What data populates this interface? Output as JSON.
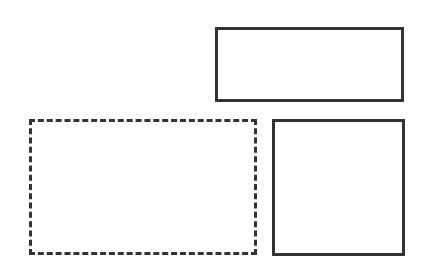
{
  "diagram": {
    "shapes": [
      {
        "id": "top-right-rectangle",
        "kind": "rectangle",
        "stroke": "solid",
        "color": "#333333"
      },
      {
        "id": "dashed-rectangle",
        "kind": "rectangle",
        "stroke": "dashed",
        "color": "#333333"
      },
      {
        "id": "square",
        "kind": "rectangle",
        "stroke": "solid",
        "color": "#333333"
      }
    ]
  }
}
